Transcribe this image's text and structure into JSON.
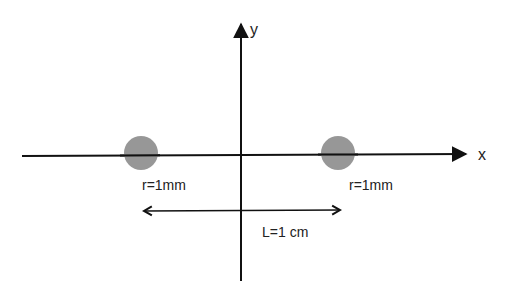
{
  "diagram": {
    "axes": {
      "x_label": "x",
      "y_label": "y"
    },
    "particles": [
      {
        "id": "left",
        "label": "r=1mm"
      },
      {
        "id": "right",
        "label": "r=1mm"
      }
    ],
    "separation": {
      "label": "L=1 cm"
    },
    "colors": {
      "line": "#111111",
      "particle_fill": "#8c8c8c",
      "text": "#222222"
    }
  }
}
